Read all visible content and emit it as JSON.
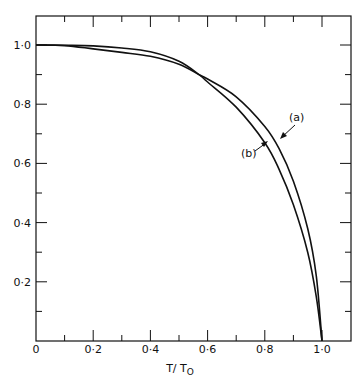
{
  "chart_data": {
    "type": "line",
    "title": "",
    "xlabel": "T/T0",
    "xlabel_main": "T/ T",
    "xlabel_sub": "O",
    "ylabel": "",
    "xlim": [
      0,
      1.1
    ],
    "ylim": [
      0,
      1.1
    ],
    "grid": false,
    "legend_position": "inline annotations",
    "x_ticks": [
      0,
      0.2,
      0.4,
      0.6,
      0.8,
      1.0
    ],
    "x_tick_labels": [
      "0",
      "0·2",
      "0·4",
      "0·6",
      "0·8",
      "1·0"
    ],
    "y_ticks": [
      0.2,
      0.4,
      0.6,
      0.8,
      1.0
    ],
    "y_tick_labels": [
      "0·2",
      "0·4",
      "0·6",
      "0·8",
      "1·0"
    ],
    "series": [
      {
        "name": "(a)",
        "x": [
          0,
          0.1,
          0.2,
          0.3,
          0.4,
          0.5,
          0.57,
          0.6,
          0.7,
          0.8,
          0.85,
          0.9,
          0.95,
          0.98,
          1.0
        ],
        "values": [
          1.0,
          0.998,
          0.987,
          0.975,
          0.962,
          0.935,
          0.9,
          0.885,
          0.825,
          0.725,
          0.65,
          0.54,
          0.38,
          0.22,
          0.0
        ]
      },
      {
        "name": "(b)",
        "x": [
          0,
          0.1,
          0.2,
          0.3,
          0.4,
          0.5,
          0.57,
          0.6,
          0.7,
          0.8,
          0.85,
          0.9,
          0.95,
          0.98,
          1.0
        ],
        "values": [
          1.0,
          0.999,
          0.997,
          0.99,
          0.977,
          0.945,
          0.9,
          0.875,
          0.79,
          0.67,
          0.58,
          0.46,
          0.3,
          0.15,
          0.0
        ]
      }
    ],
    "annotations": [
      {
        "text": "(a)",
        "points_to": "series (a) near T/T0≈0.86"
      },
      {
        "text": "(b)",
        "points_to": "series (b) near T/T0≈0.8"
      }
    ]
  }
}
